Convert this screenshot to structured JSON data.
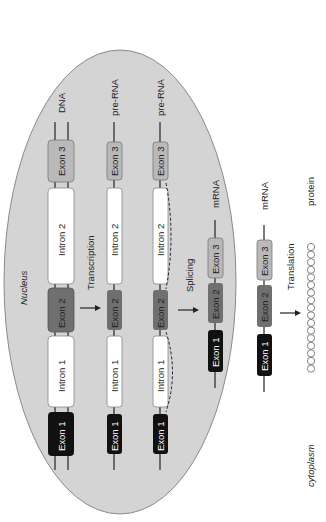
{
  "diagram": {
    "orientation": "rotated -90deg",
    "colors": {
      "nucleus_fill": "#d4d4d4",
      "nucleus_stroke": "#8a8a8a",
      "exon1": "#111111",
      "exon2": "#6f6f6f",
      "exon3": "#b9b9b9",
      "intron": "#ffffff",
      "line": "#222222"
    },
    "compartments": {
      "nucleus": "Nucleus",
      "cytoplasm": "cytoplasm"
    },
    "rows": [
      {
        "label": "DNA",
        "segments": [
          "Exon 1",
          "Intron 1",
          "Exon 2",
          "Intron 2",
          "Exon 3"
        ]
      },
      {
        "label": "pre-RNA",
        "segments": [
          "Exon 1",
          "Intron 1",
          "Exon 2",
          "Intron 2",
          "Exon 3"
        ]
      },
      {
        "label": "pre-RNA",
        "segments": [
          "Exon 1",
          "Intron 1",
          "Exon 2",
          "Intron 2",
          "Exon 3"
        ]
      },
      {
        "label": "mRNA",
        "segments": [
          "Exon 1",
          "Exon 2",
          "Exon 3"
        ]
      },
      {
        "label": "mRNA",
        "segments": [
          "Exon 1",
          "Exon 2",
          "Exon 3"
        ]
      },
      {
        "label": "protein",
        "segments": []
      }
    ],
    "steps": [
      "Transcription",
      "Splicing",
      "Translation"
    ],
    "segment_labels": {
      "exon1": "Exon 1",
      "exon2": "Exon 2",
      "exon3": "Exon 3",
      "intron1": "Intron 1",
      "intron2": "Intron 2"
    },
    "protein_residue_count": 17
  }
}
